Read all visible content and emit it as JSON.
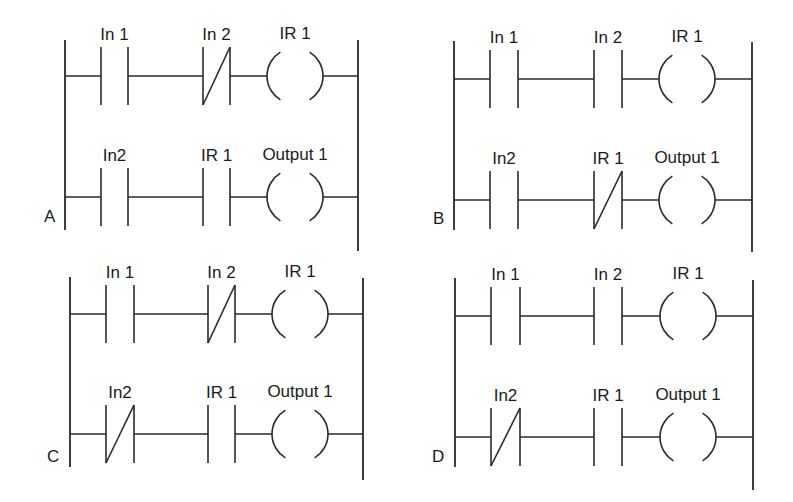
{
  "figure": {
    "stroke_color": "#2a2a2a",
    "background": "#ffffff"
  },
  "diagrams": [
    {
      "id": "A",
      "label": "A",
      "rungs": [
        {
          "elements": [
            {
              "type": "NO",
              "label": "In 1"
            },
            {
              "type": "NC",
              "label": "In 2"
            },
            {
              "type": "coil",
              "label": "IR 1"
            }
          ]
        },
        {
          "elements": [
            {
              "type": "NO",
              "label": "In2"
            },
            {
              "type": "NO",
              "label": "IR 1"
            },
            {
              "type": "coil",
              "label": "Output 1"
            }
          ]
        }
      ]
    },
    {
      "id": "B",
      "label": "B",
      "rungs": [
        {
          "elements": [
            {
              "type": "NO",
              "label": "In 1"
            },
            {
              "type": "NO",
              "label": "In 2"
            },
            {
              "type": "coil",
              "label": "IR 1"
            }
          ]
        },
        {
          "elements": [
            {
              "type": "NO",
              "label": "In2"
            },
            {
              "type": "NC",
              "label": "IR 1"
            },
            {
              "type": "coil",
              "label": "Output 1"
            }
          ]
        }
      ]
    },
    {
      "id": "C",
      "label": "C",
      "rungs": [
        {
          "elements": [
            {
              "type": "NO",
              "label": "In 1"
            },
            {
              "type": "NC",
              "label": "In 2"
            },
            {
              "type": "coil",
              "label": "IR 1"
            }
          ]
        },
        {
          "elements": [
            {
              "type": "NC",
              "label": "In2"
            },
            {
              "type": "NO",
              "label": "IR 1"
            },
            {
              "type": "coil",
              "label": "Output 1"
            }
          ]
        }
      ]
    },
    {
      "id": "D",
      "label": "D",
      "rungs": [
        {
          "elements": [
            {
              "type": "NO",
              "label": "In 1"
            },
            {
              "type": "NO",
              "label": "In 2"
            },
            {
              "type": "coil",
              "label": "IR 1"
            }
          ]
        },
        {
          "elements": [
            {
              "type": "NC",
              "label": "In2"
            },
            {
              "type": "NO",
              "label": "IR 1"
            },
            {
              "type": "coil",
              "label": "Output 1"
            }
          ]
        }
      ]
    }
  ],
  "layout": [
    {
      "left_rail_x": 65,
      "right_rail_x": 358,
      "left_rail_y": [
        40,
        230
      ],
      "right_rail_y": [
        40,
        251
      ],
      "rung_y": [
        76,
        197
      ],
      "contact1_x": [
        101,
        128
      ],
      "contact2_x": [
        203,
        230
      ],
      "coil_x": [
        267,
        323
      ],
      "label_pos": [
        44,
        222
      ]
    },
    {
      "left_rail_x": 454,
      "right_rail_x": 752,
      "left_rail_y": [
        41,
        230
      ],
      "right_rail_y": [
        42,
        252
      ],
      "rung_y": [
        79,
        200
      ],
      "contact1_x": [
        490,
        518
      ],
      "contact2_x": [
        594,
        622
      ],
      "coil_x": [
        659,
        715
      ],
      "label_pos": [
        433,
        224
      ]
    },
    {
      "left_rail_x": 70,
      "right_rail_x": 363,
      "left_rail_y": [
        277,
        467
      ],
      "right_rail_y": [
        278,
        480
      ],
      "rung_y": [
        314,
        434
      ],
      "contact1_x": [
        106,
        134
      ],
      "contact2_x": [
        208,
        235
      ],
      "coil_x": [
        272,
        328
      ],
      "label_pos": [
        47,
        462
      ]
    },
    {
      "left_rail_x": 455,
      "right_rail_x": 753,
      "left_rail_y": [
        278,
        467
      ],
      "right_rail_y": [
        280,
        490
      ],
      "rung_y": [
        316,
        437
      ],
      "contact1_x": [
        491,
        520
      ],
      "contact2_x": [
        594,
        622
      ],
      "coil_x": [
        660,
        716
      ],
      "label_pos": [
        432,
        462
      ]
    }
  ]
}
